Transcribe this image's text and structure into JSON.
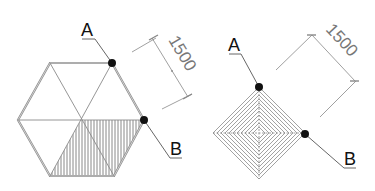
{
  "figures": [
    {
      "name": "hexagon",
      "point_a_label": "A",
      "point_b_label": "B",
      "dimension": "1500"
    },
    {
      "name": "square",
      "point_a_label": "A",
      "point_b_label": "B",
      "dimension": "1500"
    }
  ],
  "colors": {
    "outline": "#8a8a8a",
    "hatch": "#6a6a6a",
    "point": "#111111",
    "dimension": "#888888"
  }
}
